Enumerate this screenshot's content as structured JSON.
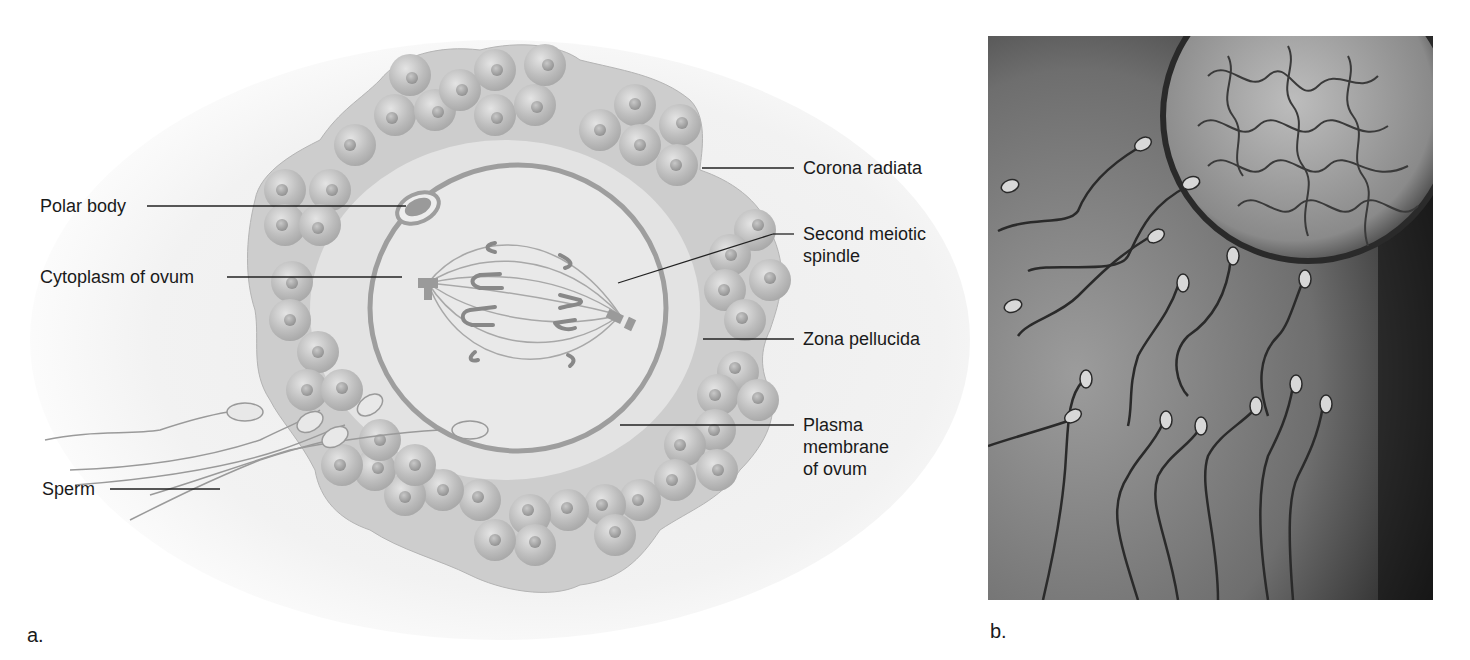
{
  "figure": {
    "panel_a": {
      "letter": "a.",
      "title": "Ovum with surrounding structures (illustration)",
      "labels": {
        "polar_body": "Polar body",
        "cytoplasm": "Cytoplasm of ovum",
        "sperm": "Sperm",
        "corona_radiata": "Corona radiata",
        "spindle_line1": "Second meiotic",
        "spindle_line2": "spindle",
        "zona_pellucida": "Zona pellucida",
        "plasma_line1": "Plasma",
        "plasma_line2": "membrane",
        "plasma_line3": "of ovum"
      }
    },
    "panel_b": {
      "letter": "b.",
      "title": "Micrograph of sperm approaching an ovum"
    },
    "colors": {
      "text": "#1a1a1a",
      "leader_line": "#222222",
      "corona_fill": "#c9c9c9",
      "zona_fill": "#e2e2e2",
      "cell_fill": "#b8b8b8",
      "membrane": "#9a9a9a",
      "photo_bg": "#6b6b6b"
    }
  }
}
